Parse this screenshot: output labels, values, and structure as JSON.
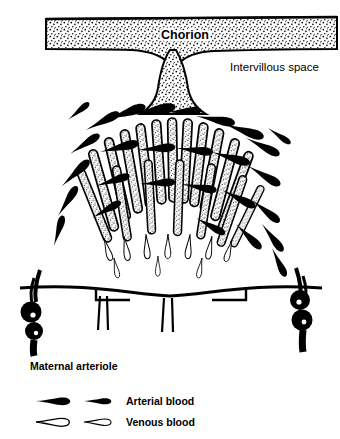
{
  "figure": {
    "title_visible": false,
    "background": "#ffffff",
    "ink": "#000000"
  },
  "labels": {
    "chorion": "Chorion",
    "intervillous_space": "Intervillous space",
    "maternal_arteriole": "Maternal arteriole"
  },
  "legend": {
    "items": [
      {
        "key": "arterial",
        "label": "Arterial blood",
        "fill": "#000000",
        "outline": "#000000"
      },
      {
        "key": "venous",
        "label": "Venous blood",
        "fill": "#ffffff",
        "outline": "#000000"
      }
    ]
  },
  "structures": [
    {
      "name": "chorionic-plate",
      "description": "stippled horizontal band at top"
    },
    {
      "name": "stem-villus-trunk",
      "description": "stippled trunk descending from chorion"
    },
    {
      "name": "villous-tree",
      "description": "dome of stippled finger-like villi"
    },
    {
      "name": "arterial-blood-streams",
      "description": "solid black teardrop streams"
    },
    {
      "name": "venous-blood-channels",
      "description": "open outlined teardrop channels"
    },
    {
      "name": "decidual-plate",
      "description": "horizontal basal line"
    },
    {
      "name": "spiral-arteriole-left",
      "description": "thick coiled black vessel"
    },
    {
      "name": "spiral-arteriole-right",
      "description": "thick coiled black vessel"
    }
  ]
}
